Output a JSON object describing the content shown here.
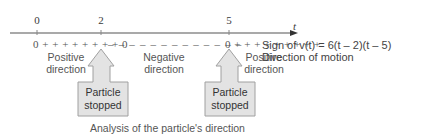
{
  "axis": {
    "variable": "t",
    "ticks": [
      {
        "value": "0",
        "x": 37
      },
      {
        "value": "2",
        "x": 101
      },
      {
        "value": "5",
        "x": 229
      }
    ]
  },
  "sign_row": {
    "segments": [
      {
        "text": "0 + + + + + + + + 0",
        "sign": "positive"
      },
      {
        "text": "– – – – – – – – – – – – –",
        "sign": "negative"
      },
      {
        "text": "0 + + + + + + + + +",
        "sign": "positive"
      }
    ],
    "label": "Sign of v(t) = 6(t – 2)(t – 5)"
  },
  "direction_row": {
    "labels": [
      "Positive direction",
      "Negative direction",
      "Positive direction"
    ],
    "label": "Direction of motion"
  },
  "stop_markers": [
    {
      "text_line1": "Particle",
      "text_line2": "stopped",
      "at": "2"
    },
    {
      "text_line1": "Particle",
      "text_line2": "stopped",
      "at": "5"
    }
  ],
  "caption": "Analysis of the particle's direction",
  "colors": {
    "axis": "#555555",
    "arrow_fill": "#e2e2e2",
    "arrow_stroke": "#9a9a9a",
    "text": "#444444"
  }
}
